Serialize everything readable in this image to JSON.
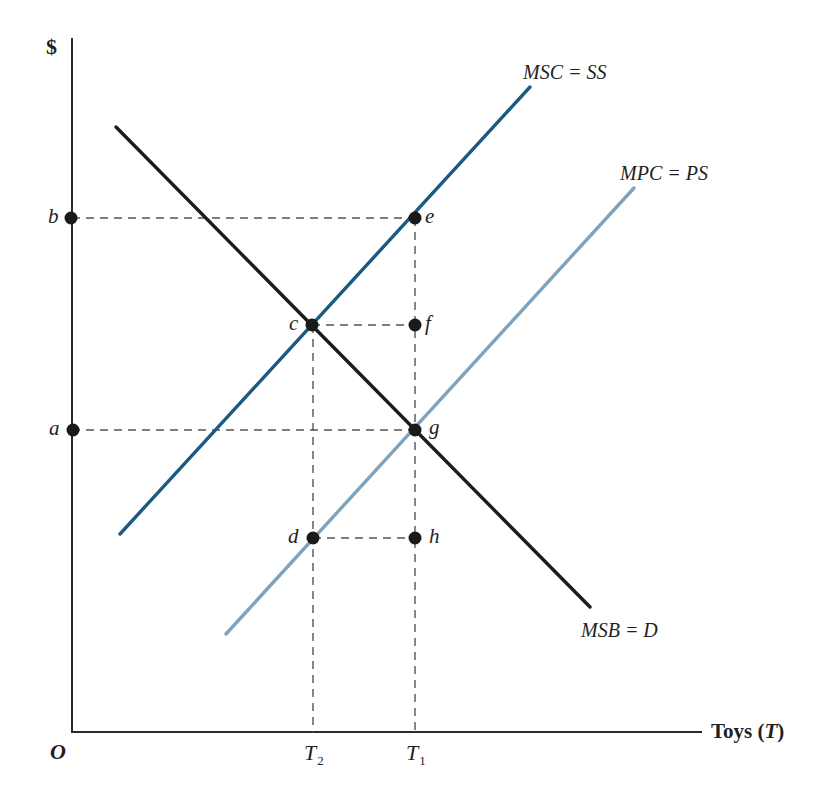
{
  "diagram": {
    "type": "supply-demand-externality",
    "y_axis": {
      "label": "$"
    },
    "x_axis": {
      "label_prefix": "Toys (",
      "label_var": "T",
      "label_suffix": ")"
    },
    "origin": "O",
    "ticks_x": [
      {
        "base": "T",
        "sub": "2"
      },
      {
        "base": "T",
        "sub": "1"
      }
    ],
    "ticks_y": [
      {
        "label": "b"
      },
      {
        "label": "a"
      }
    ],
    "curves": {
      "msc": {
        "label": "MSC = SS",
        "color": "#1c5a82"
      },
      "mpc": {
        "label": "MPC = PS",
        "color": "#7ea3bf"
      },
      "msb": {
        "label": "MSB = D",
        "color": "#1c1c1c"
      }
    },
    "points": {
      "b": "b",
      "e": "e",
      "c": "c",
      "f": "f",
      "a": "a",
      "g": "g",
      "d": "d",
      "h": "h"
    },
    "colors": {
      "axis": "#2a2a2a",
      "dash": "#555555",
      "dot": "#1a1a1a"
    }
  }
}
